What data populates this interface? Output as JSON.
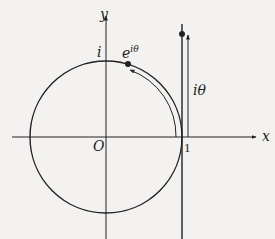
{
  "diagram": {
    "labels": {
      "y_axis": "y",
      "x_axis": "x",
      "origin": "O",
      "i_point": "i",
      "exp_point_base": "e",
      "exp_point_sup": "iθ",
      "tangent_label": "iθ",
      "one": "1"
    },
    "colors": {
      "background": "#f4f2f0",
      "stroke": "#222222"
    }
  }
}
